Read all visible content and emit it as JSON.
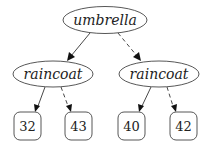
{
  "tree": {
    "root": {
      "label": "umbrella"
    },
    "internal": [
      {
        "label": "raincoat",
        "side": "left"
      },
      {
        "label": "raincoat",
        "side": "right"
      }
    ],
    "leaves": [
      {
        "label": "32"
      },
      {
        "label": "43"
      },
      {
        "label": "40"
      },
      {
        "label": "42"
      }
    ],
    "edges": [
      {
        "from": "umbrella",
        "to": "raincoat-left",
        "style": "solid"
      },
      {
        "from": "umbrella",
        "to": "raincoat-right",
        "style": "dashed"
      },
      {
        "from": "raincoat-left",
        "to": "32",
        "style": "solid"
      },
      {
        "from": "raincoat-left",
        "to": "43",
        "style": "dashed"
      },
      {
        "from": "raincoat-right",
        "to": "40",
        "style": "solid"
      },
      {
        "from": "raincoat-right",
        "to": "42",
        "style": "dashed"
      }
    ]
  }
}
